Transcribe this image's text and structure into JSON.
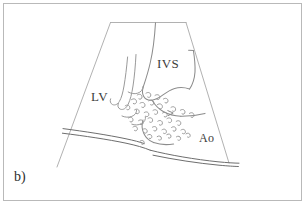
{
  "figure": {
    "panel_letter": "b)",
    "background_color": "#ffffff",
    "frame_color": "#b9b9b9",
    "line_color": "#8c8c8c",
    "wall_line_color": "#6e6e6e",
    "label_color": "#3c3c3c",
    "width": 306,
    "height": 205
  },
  "labels": {
    "left_ventricle": "LV",
    "interventricular_septum": "IVS",
    "aorta": "Ao"
  },
  "diagram_data": {
    "type": "schematic-line-drawing",
    "subject": "echocardiographic sector with turbulent jet flow through aortic valve",
    "sector": {
      "apex_left_x": 110,
      "apex_right_x": 186,
      "apex_y": 22,
      "base_left_x": 57,
      "base_right_x": 228,
      "base_y": 165
    },
    "streamlines_count": 5,
    "eddies_count": 34,
    "wall_lines_count": 2
  }
}
